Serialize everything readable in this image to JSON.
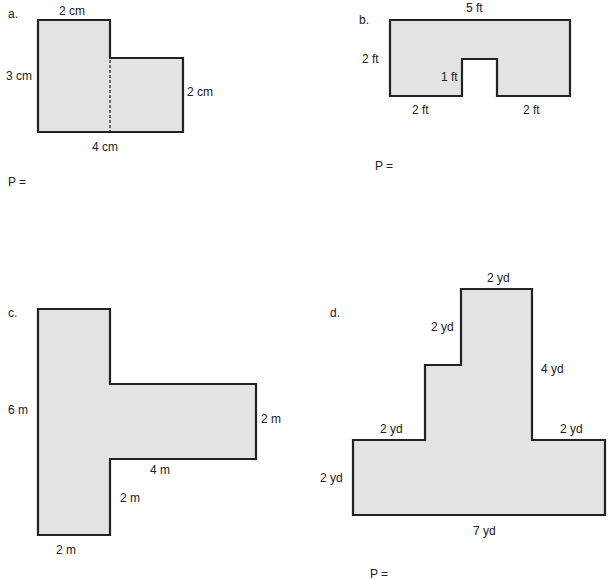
{
  "worksheet": {
    "answer_prompt": "P =",
    "problems": [
      {
        "letter": "a.",
        "shape": "L-shape",
        "labels": {
          "top": "2 cm",
          "left": "3 cm",
          "right": "2 cm",
          "bottom": "4 cm"
        },
        "has_dashed_divider": true
      },
      {
        "letter": "b.",
        "shape": "U-shape",
        "labels": {
          "top": "5 ft",
          "left": "2 ft",
          "notch": "1 ft",
          "bottom_left": "2 ft",
          "bottom_right": "2 ft"
        }
      },
      {
        "letter": "c.",
        "shape": "T-shape",
        "labels": {
          "left": "6 m",
          "arm_right": "2 m",
          "arm_bottom": "4 m",
          "stem_right": "2 m",
          "bottom": "2 m"
        }
      },
      {
        "letter": "d.",
        "shape": "stepped shape",
        "labels": {
          "top": "2 yd",
          "upper_left": "2 yd",
          "tower_right": "4 yd",
          "ledge_left": "2 yd",
          "ledge_right": "2 yd",
          "base_left": "2 yd",
          "bottom": "7 yd"
        }
      }
    ]
  }
}
